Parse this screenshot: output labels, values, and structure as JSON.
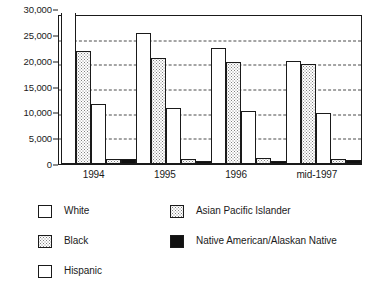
{
  "chart_data": {
    "type": "bar",
    "title": "",
    "subtitle": "",
    "xlabel": "",
    "ylabel": "",
    "categories": [
      "1994",
      "1995",
      "1996",
      "mid-1997"
    ],
    "ylim": [
      0,
      30000
    ],
    "ytick_labels": [
      "0",
      "5,000",
      "10,000",
      "15,000",
      "20,000",
      "25,000",
      "30,000"
    ],
    "ytick_values": [
      0,
      5000,
      10000,
      15000,
      20000,
      25000,
      30000
    ],
    "grid": true,
    "grid_axis": "y",
    "grid_style": "dashed",
    "legend_position": "below",
    "series": [
      {
        "name": "White",
        "fill": "white",
        "values": [
          31500,
          26600,
          23600,
          20800
        ],
        "clipped": [
          true,
          false,
          false,
          false
        ]
      },
      {
        "name": "Black",
        "fill": "dots",
        "values": [
          22900,
          21500,
          20600,
          20200
        ],
        "clipped": [
          false,
          false,
          false,
          false
        ]
      },
      {
        "name": "Hispanic",
        "fill": "white",
        "values": [
          12200,
          11400,
          10700,
          10300
        ],
        "clipped": [
          false,
          false,
          false,
          false
        ]
      },
      {
        "name": "Asian Pacific Islander",
        "fill": "dots",
        "values": [
          1100,
          1100,
          1200,
          1000
        ],
        "clipped": [
          false,
          false,
          false,
          false
        ]
      },
      {
        "name": "Native American/Alaskan Native",
        "fill": "black",
        "values": [
          1100,
          700,
          700,
          800
        ],
        "clipped": [
          false,
          false,
          false,
          false
        ]
      }
    ]
  },
  "legend": {
    "left_column": [
      {
        "label": "White",
        "swatch": "white-swatch",
        "fill": "white"
      },
      {
        "label": "Black",
        "swatch": "dotted-swatch",
        "fill": "dots"
      },
      {
        "label": "Hispanic",
        "swatch": "white-swatch",
        "fill": "white"
      }
    ],
    "right_column": [
      {
        "label": "Asian Pacific Islander",
        "swatch": "dotted-swatch",
        "fill": "dots"
      },
      {
        "label": "Native American/Alaskan Native",
        "swatch": "black-swatch",
        "fill": "black"
      }
    ]
  },
  "colors": {
    "axis": "#1a1a1a",
    "grid": "#4a4a4a",
    "bar_outline": "#1a1a1a",
    "fill_white": "#ffffff",
    "fill_dots": "#808080",
    "fill_black": "#111111",
    "background": "#ffffff"
  }
}
